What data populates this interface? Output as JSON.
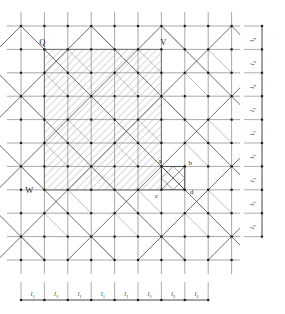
{
  "figure": {
    "type": "lattice-grid-diagram",
    "width": 285,
    "height": 314,
    "background": "#ffffff"
  },
  "grid": {
    "origin_x": 21,
    "origin_y": 26,
    "spacing_x": 23.4,
    "spacing_y": 23.4,
    "cols": 9,
    "rows": 10,
    "line_color": "#8c8c8c",
    "node_color": "#1a1a1a",
    "node_size": 2.2
  },
  "hatch": {
    "fill_color": "#ffffff",
    "hatch_color": "#9a9a9a",
    "border_color": "#6e6e6e",
    "angle_deg": 45,
    "spacing": 5.2
  },
  "points": [
    {
      "id": "Q",
      "label": "Q",
      "x": 44.4,
      "y": 49.4,
      "label_dx": -2,
      "label_dy": -4
    },
    {
      "id": "V",
      "label": "V",
      "x": 161.4,
      "y": 49.4,
      "label_dx": 2,
      "label_dy": -4
    },
    {
      "id": "W",
      "label": "W",
      "x": 44.4,
      "y": 190.0,
      "label_dx": -11,
      "label_dy": 3
    }
  ],
  "detail_square": {
    "left": 161.4,
    "top": 166.4,
    "size": 23.4,
    "vertices": [
      {
        "id": "a",
        "label": "a",
        "x": 161.4,
        "y": 163.0,
        "anchor": "end"
      },
      {
        "id": "b",
        "label": "b",
        "x": 188.5,
        "y": 164.5,
        "anchor": "start"
      },
      {
        "id": "c",
        "label": "c",
        "x": 158.0,
        "y": 198.0,
        "anchor": "end"
      },
      {
        "id": "d",
        "label": "d",
        "x": 190.0,
        "y": 194.0,
        "anchor": "start"
      }
    ]
  },
  "right_axis": {
    "name": "vertical-dimension-axis",
    "x": 262,
    "top": 26,
    "tick_len": 18,
    "segments": [
      {
        "index": 1,
        "label": "l",
        "sub": "4"
      },
      {
        "index": 2,
        "label": "l",
        "sub": "4"
      },
      {
        "index": 3,
        "label": "l",
        "sub": "4"
      },
      {
        "index": 4,
        "label": "l",
        "sub": "3"
      },
      {
        "index": 5,
        "label": "l",
        "sub": "3"
      },
      {
        "index": 6,
        "label": "l",
        "sub": "3"
      },
      {
        "index": 7,
        "label": "l",
        "sub": "3"
      },
      {
        "index": 8,
        "label": "l",
        "sub": "3"
      },
      {
        "index": 9,
        "label": "l",
        "sub": "3"
      }
    ]
  },
  "bottom_axis": {
    "name": "horizontal-dimension-axis",
    "y": 300,
    "left": 21,
    "tick_len": 18,
    "segments": [
      {
        "index": 1,
        "label": "l",
        "sub": "1"
      },
      {
        "index": 2,
        "label": "l",
        "sub": "1"
      },
      {
        "index": 3,
        "label": "l",
        "sub": "1"
      },
      {
        "index": 4,
        "label": "l",
        "sub": "1"
      },
      {
        "index": 5,
        "label": "l",
        "sub": "1"
      },
      {
        "index": 6,
        "label": "l",
        "sub": "1"
      },
      {
        "index": 7,
        "label": "l",
        "sub": "2"
      },
      {
        "index": 8,
        "label": "l",
        "sub": "2"
      }
    ]
  }
}
